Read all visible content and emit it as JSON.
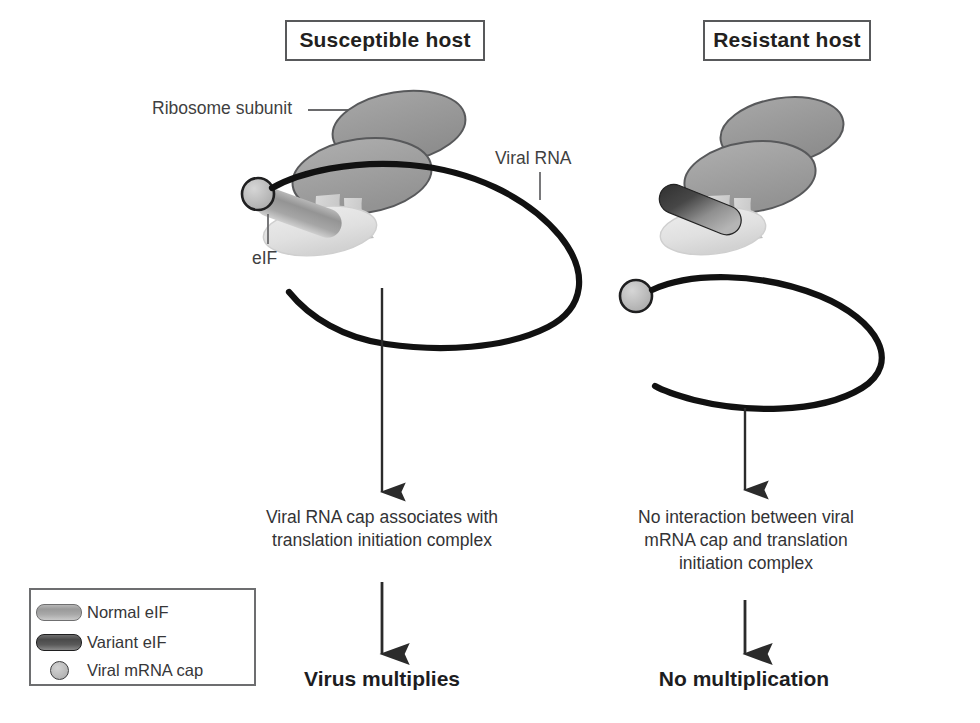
{
  "figure": {
    "background": "#ffffff"
  },
  "panels": {
    "left": {
      "header": "Susceptible host",
      "caption": "Viral RNA cap associates with translation initiation complex",
      "outcome": "Virus multiplies"
    },
    "right": {
      "header": "Resistant host",
      "caption": "No interaction between viral mRNA cap and translation initiation complex",
      "outcome": "No multiplication"
    }
  },
  "annotations": {
    "ribosome": "Ribosome subunit",
    "viral_rna": "Viral RNA",
    "eif": "eIF"
  },
  "legend": {
    "items": [
      {
        "label": "Normal eIF",
        "swatch": "capsule-light"
      },
      {
        "label": "Variant eIF",
        "swatch": "capsule-dark"
      },
      {
        "label": "Viral mRNA cap",
        "swatch": "circle-gray"
      }
    ]
  },
  "colors": {
    "ribosome_fill": "#9a9a9a",
    "ribosome_stroke": "#58595b",
    "eif_complex_fill": "#dcdcdc",
    "normal_eif": "#a8a8a8",
    "variant_eif": "#4a4a4a",
    "mrna_cap": "#bcbcbc",
    "rna_strand": "#1a1a1a",
    "arrow": "#2b2b2b",
    "box_border": "#58595b",
    "text": "#231f20"
  }
}
